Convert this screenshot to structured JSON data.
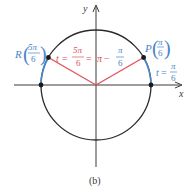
{
  "figure": {
    "caption": "(b)",
    "axes": {
      "x_label": "x",
      "y_label": "y"
    },
    "colors": {
      "axis": "#3a3a3a",
      "circle": "#2b2b2b",
      "arc_highlight": "#4a86c5",
      "radius_lines": "#e0505a",
      "point": "#1a1a1a",
      "label_blue": "#4a86c5",
      "label_red": "#e0505a"
    },
    "points": {
      "P": {
        "name": "P",
        "arg_num": "π",
        "arg_den": "6"
      },
      "R": {
        "name": "R",
        "arg_num": "5π",
        "arg_den": "6"
      }
    },
    "labels": {
      "t_right": {
        "var": "t",
        "eq": "=",
        "num": "π",
        "den": "6"
      },
      "t_left": {
        "var": "t",
        "eq": "=",
        "num": "5π",
        "den": "6",
        "eq2": "=",
        "pi": "π",
        "minus": "−",
        "num2": "π",
        "den2": "6"
      }
    }
  }
}
